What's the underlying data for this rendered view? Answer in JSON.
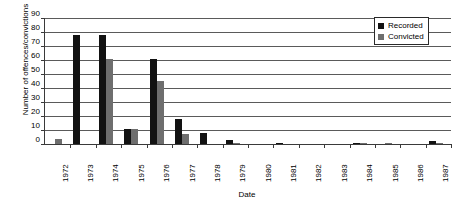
{
  "chart_data": {
    "type": "bar",
    "title": "",
    "xlabel": "Date",
    "ylabel": "Number of offences/convictions",
    "ylim": [
      0,
      90
    ],
    "ytick_step": 10,
    "yticks": [
      90,
      80,
      70,
      60,
      50,
      40,
      30,
      20,
      10,
      0
    ],
    "grid": true,
    "legend_position": "top-right",
    "categories": [
      "1972",
      "1973",
      "1974",
      "1975",
      "1976",
      "1977",
      "1978",
      "1979",
      "1980",
      "1981",
      "1982",
      "1983",
      "1984",
      "1985",
      "1986",
      "1987"
    ],
    "series": [
      {
        "name": "Recorded",
        "color": "#121212",
        "values": [
          0,
          78,
          78,
          11,
          61,
          18,
          8,
          3,
          0,
          1,
          0,
          0,
          1,
          0,
          0,
          2
        ]
      },
      {
        "name": "Convicted",
        "color": "#6e6e6e",
        "values": [
          3.5,
          0,
          61,
          11,
          45,
          7,
          0,
          1,
          0,
          0,
          0,
          0,
          0.5,
          0.5,
          0,
          1
        ]
      }
    ]
  },
  "legend": {
    "items": [
      {
        "label": "Recorded",
        "color": "#121212"
      },
      {
        "label": "Convicted",
        "color": "#6e6e6e"
      }
    ]
  }
}
